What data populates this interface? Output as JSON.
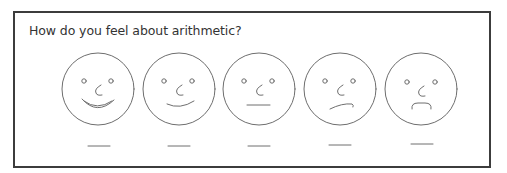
{
  "survey": {
    "question": "How do you feel about arithmetic?",
    "options": [
      {
        "id": "very-happy",
        "mood": "very happy",
        "answer": ""
      },
      {
        "id": "happy",
        "mood": "happy",
        "answer": ""
      },
      {
        "id": "neutral",
        "mood": "neutral",
        "answer": ""
      },
      {
        "id": "unhappy",
        "mood": "unhappy",
        "answer": ""
      },
      {
        "id": "very-unhappy",
        "mood": "very unhappy",
        "answer": ""
      }
    ]
  },
  "colors": {
    "frame": "#3c3c3c",
    "stroke": "#6e6e6e",
    "text": "#333333"
  }
}
